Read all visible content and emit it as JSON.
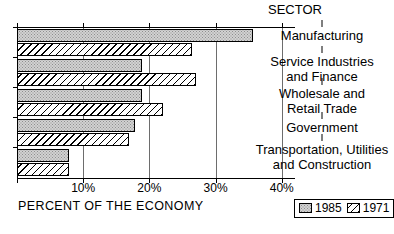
{
  "chart_data": {
    "type": "bar",
    "orientation": "horizontal",
    "title": "",
    "xlabel": "PERCENT OF THE ECONOMY",
    "ylabel": "SECTOR",
    "xlim": [
      0,
      42
    ],
    "grid": true,
    "legend_position": "bottom-right",
    "xticks": [
      "10%",
      "20%",
      "30%",
      "40%"
    ],
    "xtick_values": [
      10,
      20,
      30,
      40
    ],
    "categories": [
      "Manufacturing",
      "Service Industries and Finance",
      "Wholesale and Retail Trade",
      "Government",
      "Transportation, Utilities and Construction"
    ],
    "series": [
      {
        "name": "1985",
        "values": [
          35.6,
          18.9,
          18.9,
          17.9,
          7.9
        ]
      },
      {
        "name": "1971",
        "values": [
          26.5,
          27.0,
          22.0,
          16.9,
          7.8
        ]
      }
    ]
  },
  "axis": {
    "title": "PERCENT OF THE ECONOMY",
    "ticks": [
      {
        "label": "10%",
        "value": 10
      },
      {
        "label": "20%",
        "value": 20
      },
      {
        "label": "30%",
        "value": 30
      },
      {
        "label": "40%",
        "value": 40
      }
    ]
  },
  "sector_column": {
    "heading": "SECTOR",
    "labels": [
      {
        "lines": [
          "Manufacturing"
        ]
      },
      {
        "lines": [
          "Service Industries",
          "and Finance"
        ]
      },
      {
        "lines": [
          "Wholesale and",
          "Retail Trade"
        ]
      },
      {
        "lines": [
          "Government"
        ]
      },
      {
        "lines": [
          "Transportation, Utilities",
          "and Construction"
        ]
      }
    ]
  },
  "legend": {
    "items": [
      {
        "label": "1985",
        "pattern": "stipple-grey",
        "color": "#d2d2d2"
      },
      {
        "label": "1971",
        "pattern": "diagonal-hatch",
        "color": "#ffffff"
      }
    ]
  }
}
